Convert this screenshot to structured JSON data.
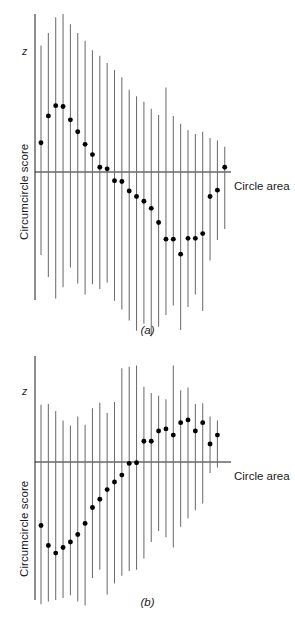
{
  "figure": {
    "axis_color": "#000000",
    "bar_color": "#6e6e6e",
    "point_color": "#000000",
    "background": "#ffffff"
  },
  "labels": {
    "y_axis": "Circumcircle score",
    "x_axis": "Circle area",
    "z_marker": "z",
    "panel_a_tag": "(a)",
    "panel_b_tag": "(b)"
  },
  "chart_data": [
    {
      "id": "panel-a",
      "type": "scatter",
      "title": "(a)",
      "xlabel": "Circle area",
      "ylabel": "Circumcircle score",
      "axis_annotation": "z",
      "grid": false,
      "legend": null,
      "xlim": [
        0,
        28
      ],
      "ylim": [
        -1.05,
        1.05
      ],
      "zero_line": 0,
      "series": [
        {
          "name": "Circumcircle score vs circle area (a)",
          "marker": "filled-circle",
          "errorbar": "vertical-line",
          "points": [
            {
              "x": 1,
              "y": 0.185,
              "lo": -0.525,
              "hi": 0.8
            },
            {
              "x": 2,
              "y": 0.355,
              "lo": -0.665,
              "hi": 0.88
            },
            {
              "x": 3,
              "y": 0.42,
              "lo": -0.8,
              "hi": 0.98
            },
            {
              "x": 4,
              "y": 0.415,
              "lo": -0.73,
              "hi": 1.0
            },
            {
              "x": 5,
              "y": 0.33,
              "lo": -0.605,
              "hi": 0.935
            },
            {
              "x": 6,
              "y": 0.255,
              "lo": -0.705,
              "hi": 0.88
            },
            {
              "x": 7,
              "y": 0.175,
              "lo": -0.775,
              "hi": 0.83
            },
            {
              "x": 8,
              "y": 0.11,
              "lo": -0.71,
              "hi": 0.77
            },
            {
              "x": 9,
              "y": 0.03,
              "lo": -0.74,
              "hi": 0.735
            },
            {
              "x": 10,
              "y": 0.02,
              "lo": -0.7,
              "hi": 0.69
            },
            {
              "x": 11,
              "y": -0.055,
              "lo": -0.815,
              "hi": 0.645
            },
            {
              "x": 12,
              "y": -0.06,
              "lo": -0.87,
              "hi": 0.6
            },
            {
              "x": 13,
              "y": -0.12,
              "lo": -0.94,
              "hi": 0.52
            },
            {
              "x": 14,
              "y": -0.155,
              "lo": -1.005,
              "hi": 0.48
            },
            {
              "x": 15,
              "y": -0.185,
              "lo": -0.96,
              "hi": 0.445
            },
            {
              "x": 16,
              "y": -0.23,
              "lo": -1.04,
              "hi": 0.4
            },
            {
              "x": 17,
              "y": -0.32,
              "lo": -0.98,
              "hi": 0.36
            },
            {
              "x": 18,
              "y": -0.425,
              "lo": -0.905,
              "hi": 0.535
            },
            {
              "x": 19,
              "y": -0.425,
              "lo": -0.845,
              "hi": 0.355
            },
            {
              "x": 20,
              "y": -0.52,
              "lo": -1.0,
              "hi": 0.305
            },
            {
              "x": 21,
              "y": -0.42,
              "lo": -0.855,
              "hi": 0.265
            },
            {
              "x": 22,
              "y": -0.42,
              "lo": -0.775,
              "hi": 0.24
            },
            {
              "x": 23,
              "y": -0.39,
              "lo": -0.88,
              "hi": 0.255
            },
            {
              "x": 24,
              "y": -0.155,
              "lo": -0.56,
              "hi": 0.215
            },
            {
              "x": 25,
              "y": -0.115,
              "lo": -0.43,
              "hi": 0.2
            },
            {
              "x": 26,
              "y": 0.03,
              "lo": -0.36,
              "hi": 0.16
            }
          ]
        }
      ]
    },
    {
      "id": "panel-b",
      "type": "scatter",
      "title": "(b)",
      "xlabel": "Circle area",
      "ylabel": "Circumcircle score",
      "axis_annotation": "z",
      "grid": false,
      "legend": null,
      "xlim": [
        0,
        28
      ],
      "ylim": [
        -1.05,
        1.05
      ],
      "zero_line": 0,
      "series": [
        {
          "name": "Circumcircle score vs circle area (b)",
          "marker": "filled-circle",
          "errorbar": "vertical-line",
          "points": [
            {
              "x": 1,
              "y": -0.46,
              "lo": -1.03,
              "hi": 0.415
            },
            {
              "x": 2,
              "y": -0.605,
              "lo": -1.01,
              "hi": 0.42
            },
            {
              "x": 3,
              "y": -0.66,
              "lo": -1.0,
              "hi": 0.37
            },
            {
              "x": 4,
              "y": -0.62,
              "lo": -0.985,
              "hi": 0.3
            },
            {
              "x": 5,
              "y": -0.58,
              "lo": -0.965,
              "hi": 0.265
            },
            {
              "x": 6,
              "y": -0.525,
              "lo": -1.01,
              "hi": 0.33
            },
            {
              "x": 7,
              "y": -0.445,
              "lo": -1.04,
              "hi": 0.27
            },
            {
              "x": 8,
              "y": -0.33,
              "lo": -0.84,
              "hi": 0.39
            },
            {
              "x": 9,
              "y": -0.27,
              "lo": -0.78,
              "hi": 0.43
            },
            {
              "x": 10,
              "y": -0.2,
              "lo": -0.96,
              "hi": 0.355
            },
            {
              "x": 11,
              "y": -0.145,
              "lo": -0.88,
              "hi": 0.435
            },
            {
              "x": 12,
              "y": -0.095,
              "lo": -0.825,
              "hi": 0.68
            },
            {
              "x": 13,
              "y": -0.01,
              "lo": -0.79,
              "hi": 0.69
            },
            {
              "x": 14,
              "y": -0.005,
              "lo": -0.78,
              "hi": 0.7
            },
            {
              "x": 15,
              "y": 0.15,
              "lo": -0.7,
              "hi": 0.545
            },
            {
              "x": 16,
              "y": 0.15,
              "lo": -0.58,
              "hi": 0.5
            },
            {
              "x": 17,
              "y": 0.225,
              "lo": -0.5,
              "hi": 0.48
            },
            {
              "x": 18,
              "y": 0.24,
              "lo": -0.545,
              "hi": 0.455
            },
            {
              "x": 19,
              "y": 0.195,
              "lo": -0.62,
              "hi": 0.7
            },
            {
              "x": 20,
              "y": 0.285,
              "lo": -0.47,
              "hi": 0.52
            },
            {
              "x": 21,
              "y": 0.305,
              "lo": -0.41,
              "hi": 0.54
            },
            {
              "x": 22,
              "y": 0.225,
              "lo": -0.35,
              "hi": 0.42
            },
            {
              "x": 23,
              "y": 0.285,
              "lo": -0.3,
              "hi": 0.425
            },
            {
              "x": 24,
              "y": 0.13,
              "lo": -0.08,
              "hi": 0.33
            },
            {
              "x": 25,
              "y": 0.195,
              "lo": -0.04,
              "hi": 0.3
            }
          ]
        }
      ]
    }
  ]
}
